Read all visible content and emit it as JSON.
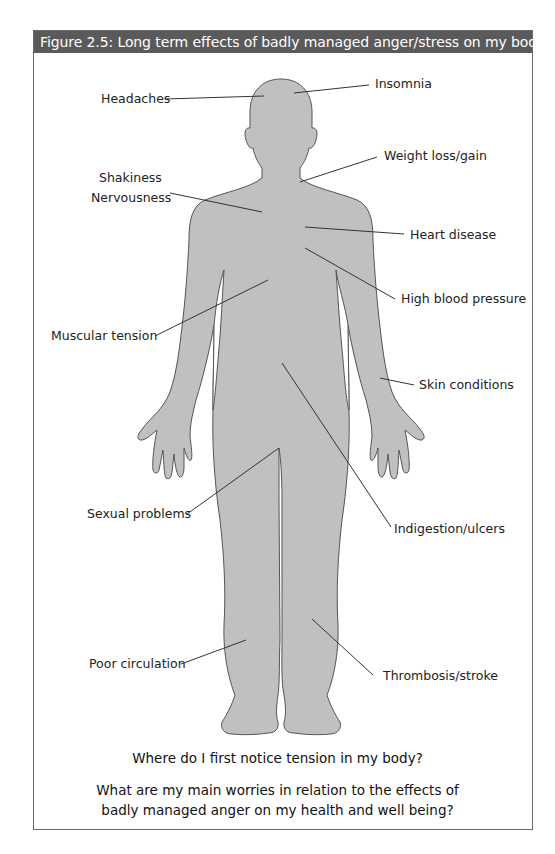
{
  "figure": {
    "title": "Figure 2.5: Long term effects of badly managed anger/stress on my body",
    "colors": {
      "header_bg": "#5a5a5a",
      "header_text": "#ffffff",
      "body_fill": "#c0c0c0",
      "body_outline": "#555555",
      "leader_line": "#333333"
    },
    "labels": {
      "insomnia": "Insomnia",
      "headaches": "Headaches",
      "weight": "Weight loss/gain",
      "shakiness": "Shakiness",
      "nervousness": "Nervousness",
      "heart": "Heart disease",
      "blood_pressure": "High blood pressure",
      "muscular": "Muscular tension",
      "skin": "Skin conditions",
      "sexual": "Sexual problems",
      "indigestion": "Indigestion/ulcers",
      "circulation": "Poor circulation",
      "thrombosis": "Thrombosis/stroke"
    },
    "questions": {
      "q1": "Where do I first notice tension in my body?",
      "q2_line1": "What are my main worries in relation to the effects of",
      "q2_line2": "badly managed anger on my health and well being?"
    }
  }
}
